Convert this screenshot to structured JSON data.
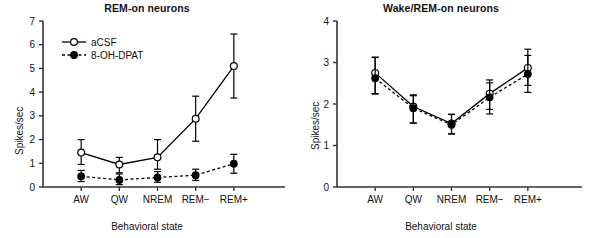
{
  "figure": {
    "background": "#ffffff",
    "axis_color": "#333333",
    "series_colors": {
      "aCSF": "#000000",
      "8-OH-DPAT": "#000000"
    }
  },
  "panels": [
    {
      "id": "rem-on",
      "title": "REM-on neurons",
      "ylabel": "Spikes/sec",
      "xlabel": "Behavioral state",
      "legend": {
        "position": "top-left",
        "entries": [
          {
            "label": "aCSF",
            "marker": "open-circle",
            "line": "solid"
          },
          {
            "label": "8-OH-DPAT",
            "marker": "filled-circle",
            "line": "dashed"
          }
        ]
      },
      "chart_data": {
        "type": "line",
        "title": "REM-on neurons",
        "xlabel": "Behavioral state",
        "ylabel": "Spikes/sec",
        "categories": [
          "AW",
          "QW",
          "NREM",
          "REM−",
          "REM+"
        ],
        "ylim": [
          0,
          7
        ],
        "yticks": [
          0,
          1,
          2,
          3,
          4,
          5,
          6,
          7
        ],
        "grid": false,
        "errorbars": true,
        "series": [
          {
            "name": "aCSF",
            "marker": "open-circle",
            "line": "solid",
            "values": [
              1.45,
              0.95,
              1.25,
              2.88,
              5.1
            ],
            "err_low": [
              0.5,
              0.35,
              0.5,
              0.95,
              1.35
            ],
            "err_high": [
              0.55,
              0.3,
              0.75,
              0.95,
              1.35
            ]
          },
          {
            "name": "8-OH-DPAT",
            "marker": "filled-circle",
            "line": "dashed",
            "values": [
              0.45,
              0.3,
              0.4,
              0.5,
              0.98
            ],
            "err_low": [
              0.22,
              0.2,
              0.2,
              0.22,
              0.4
            ],
            "err_high": [
              0.25,
              0.25,
              0.25,
              0.25,
              0.4
            ]
          }
        ]
      }
    },
    {
      "id": "wake-rem-on",
      "title": "Wake/REM-on neurons",
      "ylabel": "Spikes/sec",
      "xlabel": "Behavioral state",
      "legend": null,
      "chart_data": {
        "type": "line",
        "title": "Wake/REM-on neurons",
        "xlabel": "Behavioral state",
        "ylabel": "Spikes/sec",
        "categories": [
          "AW",
          "QW",
          "NREM",
          "REM−",
          "REM+"
        ],
        "ylim": [
          0,
          4
        ],
        "yticks": [
          0,
          1,
          2,
          3,
          4
        ],
        "grid": false,
        "errorbars": true,
        "series": [
          {
            "name": "aCSF",
            "marker": "open-circle",
            "line": "solid",
            "values": [
              2.75,
              1.94,
              1.53,
              2.25,
              2.87
            ],
            "err_low": [
              0.5,
              0.4,
              0.25,
              0.38,
              0.42
            ],
            "err_high": [
              0.38,
              0.28,
              0.22,
              0.33,
              0.45
            ]
          },
          {
            "name": "8-OH-DPAT",
            "marker": "filled-circle",
            "line": "dashed",
            "values": [
              2.62,
              1.9,
              1.5,
              2.16,
              2.72
            ],
            "err_low": [
              0.38,
              0.36,
              0.22,
              0.4,
              0.44
            ],
            "err_high": [
              0.5,
              0.3,
              0.25,
              0.35,
              0.45
            ]
          }
        ]
      }
    }
  ]
}
